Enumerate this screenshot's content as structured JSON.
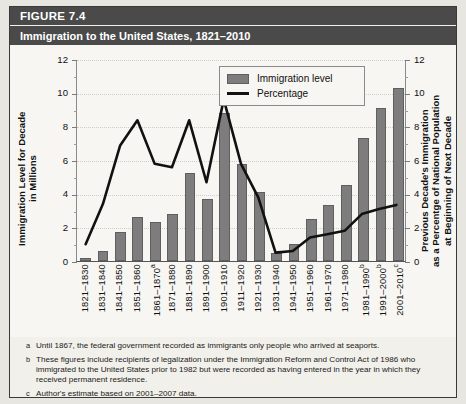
{
  "figure": {
    "number_label": "FIGURE 7.4",
    "title": "Immigration to the United States, 1821–2010"
  },
  "legend": {
    "items": [
      {
        "label": "Immigration level",
        "marker": "bar-swatch",
        "color": "#7d7d7d"
      },
      {
        "label": "Percentage",
        "marker": "line-swatch",
        "color": "#111111"
      }
    ]
  },
  "axes": {
    "left_title": "Immigration Level for Decade\nin Millions",
    "right_title": "Previous Decade's Immigration\nas a Percentge of National Population\nat Beginning of Next Decade",
    "left_ticks": [
      "0",
      "2",
      "4",
      "6",
      "8",
      "10",
      "12"
    ],
    "right_ticks": [
      "0",
      "2",
      "4",
      "6",
      "8",
      "10",
      "12"
    ]
  },
  "footnotes": [
    {
      "mark": "a",
      "text": "Until 1867, the federal government recorded as immigrants only people who arrived at seaports."
    },
    {
      "mark": "b",
      "text": "These figures include recipients of legalization under the Immigration Reform and Control Act of 1986 who immigrated to the United States prior to 1982 but were recorded as having entered in the year in which they received permanent residence."
    },
    {
      "mark": "c",
      "text": "Author's estimate based on 2001–2007 data."
    }
  ],
  "chart_data": {
    "type": "bar",
    "title": "Immigration to the United States, 1821–2010",
    "xlabel": "",
    "ylabel": "Immigration Level for Decade in Millions",
    "y2label": "Previous Decade's Immigration as a Percentge of National Population at Beginning of Next Decade",
    "ylim": [
      0,
      12
    ],
    "y2lim": [
      0,
      12
    ],
    "grid": true,
    "legend_position": "top-center",
    "categories": [
      "1821–1830",
      "1831–1840",
      "1841–1850",
      "1851–1860",
      "1861–1870a",
      "1871–1880",
      "1881–1890",
      "1891–1900",
      "1901–1910",
      "1911–1920",
      "1921–1930",
      "1931–1940",
      "1941–1950",
      "1951–1960",
      "1961–1970",
      "1971–1980",
      "1981–1990b",
      "1991–2000b",
      "2001–2010c"
    ],
    "category_superscripts": [
      "",
      "",
      "",
      "",
      "a",
      "",
      "",
      "",
      "",
      "",
      "",
      "",
      "",
      "",
      "",
      "",
      "b",
      "b",
      "c"
    ],
    "series": [
      {
        "name": "Immigration level",
        "type": "bar",
        "axis": "left",
        "units": "millions",
        "values": [
          0.15,
          0.6,
          1.7,
          2.6,
          2.3,
          2.8,
          5.25,
          3.7,
          8.8,
          5.75,
          4.1,
          0.5,
          1.0,
          2.5,
          3.3,
          4.5,
          7.3,
          9.1,
          10.3
        ]
      },
      {
        "name": "Percentage",
        "type": "line",
        "axis": "right",
        "units": "percent",
        "values": [
          1.0,
          3.4,
          6.9,
          8.4,
          5.8,
          5.6,
          8.4,
          4.7,
          9.65,
          5.8,
          3.8,
          0.5,
          0.6,
          1.4,
          1.6,
          1.8,
          2.8,
          3.1,
          3.35
        ]
      }
    ]
  }
}
